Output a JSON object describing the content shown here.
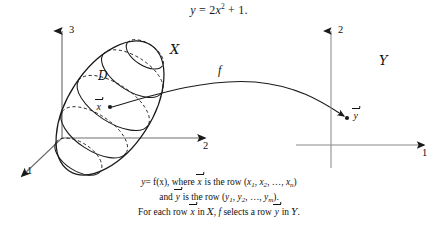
{
  "figure": {
    "equation_top": {
      "lhs": "y",
      "eq": "=",
      "rhs_coeff": "2",
      "rhs_var": "x",
      "rhs_exp": "2",
      "plus": "+",
      "rhs_const": "1",
      "period": "."
    },
    "domain_diagram": {
      "axis_vertical_label": "3",
      "axis_horizontal_label": "2",
      "axis_depth_label": "1",
      "set_label": "ᵑ7",
      "set_label_text": "X",
      "subregion_label": "D",
      "point_label": "x",
      "point_label_full": "x⃗"
    },
    "map": {
      "label": "f"
    },
    "codomain_diagram": {
      "axis_vertical_label": "2",
      "axis_horizontal_label": "1",
      "set_label_text": "Y",
      "point_label": "y",
      "point_label_full": "y⃗"
    },
    "caption": {
      "line1_a": "y",
      "line1_b": "= f(x), where ",
      "line1_vec": "x",
      "line1_c": " is the row (",
      "line1_x1": "x",
      "line1_x1sub": "1",
      "line1_x2": "x",
      "line1_x2sub": "2",
      "line1_dots": ", …, ",
      "line1_xn": "x",
      "line1_xnsub": "n",
      "line1_d": ")",
      "line2_a": "and ",
      "line2_vec": "y",
      "line2_b": " is the row (",
      "line2_y1": "y",
      "line2_y1sub": "1",
      "line2_y2": "y",
      "line2_y2sub": "2",
      "line2_dots": ", …, ",
      "line2_ym": "y",
      "line2_ymsub": "m",
      "line2_c": ").",
      "line3_a": "For each row ",
      "line3_vecx": "x",
      "line3_b": " in ",
      "line3_setx": "X",
      "line3_c": ", ",
      "line3_f": "f",
      "line3_d": " selects a row ",
      "line3_vecy": "y",
      "line3_e": " in ",
      "line3_sety": "Y",
      "line3_f_end": "."
    },
    "colors": {
      "ink": "#1a1a1a",
      "axis": "#6b6b6b",
      "background": "#ffffff"
    }
  }
}
